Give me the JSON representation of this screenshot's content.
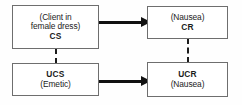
{
  "diagram": {
    "type": "flow-diagram",
    "background_color": "#fefefe",
    "line_color": "#111111",
    "border_color": "#6e6e6e",
    "text_color": "#1b1b1b",
    "boxes": [
      {
        "id": "cs",
        "position": "top-left",
        "line1": "(Client in",
        "line2": "female dress)",
        "label": "CS"
      },
      {
        "id": "cr",
        "position": "top-right",
        "line1": "(Nausea)",
        "label": "CR"
      },
      {
        "id": "ucs",
        "position": "bottom-left",
        "label": "UCS",
        "line1": "(Emetic)"
      },
      {
        "id": "ucr",
        "position": "bottom-right",
        "label": "UCR",
        "line1": "(Nausea)"
      }
    ],
    "connectors": [
      {
        "id": "cs-to-cr",
        "style": "solid-arrow",
        "from": "CS",
        "to": "CR",
        "direction": "right"
      },
      {
        "id": "ucs-to-ucr",
        "style": "solid-arrow",
        "from": "UCS",
        "to": "UCR",
        "direction": "right"
      },
      {
        "id": "cs-to-ucs",
        "style": "dashed-line",
        "from": "CS",
        "to": "UCS",
        "direction": "vertical"
      },
      {
        "id": "cr-to-ucr",
        "style": "dashed-line",
        "from": "CR",
        "to": "UCR",
        "direction": "vertical"
      }
    ]
  }
}
